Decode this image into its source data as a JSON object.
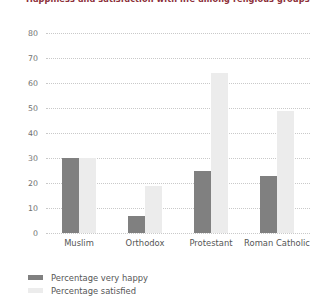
{
  "chart_data": {
    "type": "bar",
    "title": "Happiness and satisfaction with life among religious groups",
    "xlabel": "",
    "ylabel": "",
    "ylim": [
      0,
      80
    ],
    "yticks": [
      0,
      10,
      20,
      30,
      40,
      50,
      60,
      70,
      80
    ],
    "grid": true,
    "legend_position": "bottom-left",
    "categories": [
      "Muslim",
      "Orthodox",
      "Protestant",
      "Roman Catholic"
    ],
    "series": [
      {
        "name": "Percentage very happy",
        "color": "#808080",
        "values": [
          30,
          7,
          25,
          23
        ]
      },
      {
        "name": "Percentage satisfied",
        "color": "#ececec",
        "values": [
          30,
          19,
          64,
          49
        ]
      }
    ]
  },
  "colors": {
    "title": "#8c2f39",
    "gridline": "#c9c9c9",
    "tick_text": "#6f6f6f",
    "label_text": "#555555",
    "background": "#ffffff"
  }
}
